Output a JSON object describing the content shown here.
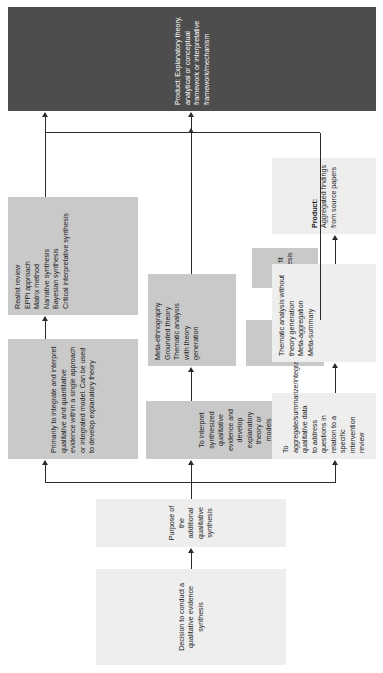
{
  "figure": {
    "type": "flowchart",
    "orientation": "rotated-90"
  },
  "colors": {
    "light_box": "#eeeeee",
    "mid_box": "#c9c9c9",
    "dark_box": "#4d4d4d",
    "dark_box_text": "#ffffff",
    "connector": "#2b2b2b",
    "text": "#1a1a1a"
  },
  "nodes": {
    "start": {
      "label": "Decision to conduct a qualitative evidence synthesis",
      "style": "light"
    },
    "purpose": {
      "label": "Purpose of the additional qualitative synthesis",
      "style": "light"
    },
    "branch_integrate": {
      "label": "Primarily to integrate and interpret qualitative and quantitative evidence within a single approach or integrated model. Can be used to develop explanatory theory",
      "style": "mid"
    },
    "branch_interpret": {
      "label": "To interpret synthesized qualitative evidence and develop explanatory theory or models",
      "style": "mid"
    },
    "branch_aggregate": {
      "label": "To aggregate/summarize/integrate qualitative data to address questions in relation to a specific intervention review",
      "style": "light"
    },
    "methods_integrate": {
      "style": "mid",
      "items": [
        "Realist review",
        "EPPI approach",
        "Matrix method",
        "Narrative synthesis",
        "Bayesian synthesis",
        "Critical interpretative synthesis"
      ]
    },
    "methods_interpret": {
      "style": "mid",
      "items": [
        "Meta-ethnography",
        "Grounded theory",
        "Thematic analysis",
        "with theory",
        "generation"
      ]
    },
    "framework_synthesis": {
      "label": "Framework synthesis",
      "style": "mid"
    },
    "best_fit_synthesis": {
      "label": "Best fit synthesis",
      "style": "mid"
    },
    "cycle_icon": {
      "name": "circular-arrows-icon"
    },
    "methods_aggregate": {
      "style": "light",
      "items": [
        "Thematic analysis without",
        "theory generation",
        "Meta-aggregation",
        "Meta-summary"
      ]
    },
    "product_theory": {
      "label": "Product: Explanatory theory, analytical or conceptual framework or interpretative framework/mechanism",
      "style": "dark"
    },
    "product_aggregated": {
      "label_bold": "Product:",
      "label_rest": " Aggregated findings from source papers",
      "style": "light"
    }
  }
}
